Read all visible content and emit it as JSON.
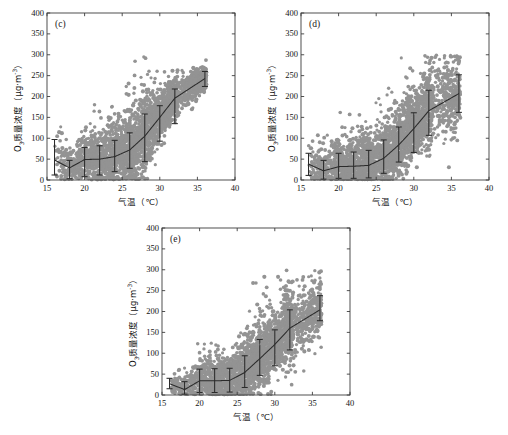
{
  "figure": {
    "background_color": "#ffffff",
    "scatter_color": "#939393",
    "line_color": "#2b2b2b",
    "axis_color": "#3d3d3d",
    "text_color": "#141414"
  },
  "axis_titles": {
    "x": "气温（℃）",
    "x_plain": "气温 (℃)",
    "y_prefix": "O",
    "y_sub": "3",
    "y_mid": "质量浓度（μg·m",
    "y_sup": "-3",
    "y_suffix": "）"
  },
  "ticks": {
    "x_labels": [
      "15",
      "20",
      "25",
      "30",
      "35",
      "40"
    ],
    "x_values": [
      15,
      20,
      25,
      30,
      35,
      40
    ],
    "y_labels": [
      "0",
      "50",
      "100",
      "150",
      "200",
      "250",
      "300",
      "350",
      "400"
    ],
    "y_values": [
      0,
      50,
      100,
      150,
      200,
      250,
      300,
      350,
      400
    ]
  },
  "chart_data": [
    {
      "id": "panel-c",
      "type": "scatter",
      "title": "(c)",
      "xlabel": "气温（℃）",
      "ylabel": "O3质量浓度（μg·m-3）",
      "xlim": [
        15,
        40
      ],
      "ylim": [
        0,
        400
      ],
      "grid": false,
      "legend": "none",
      "n_points": 2600,
      "scatter_hint": {
        "x_range": [
          16.0,
          36.2
        ],
        "core_x_range": [
          19.5,
          32.5
        ],
        "trend": "monotonic-increasing-convex",
        "spread_note": "dense saturated cloud between 20-32 C spanning 0-200; sparse tail above 32 C up to 300"
      },
      "mean_curve": {
        "x": [
          16,
          18,
          20,
          22,
          24,
          26,
          28,
          30,
          32,
          36
        ],
        "y": [
          48,
          29,
          49,
          50,
          56,
          72,
          105,
          150,
          196,
          243
        ]
      },
      "error_bars": {
        "x": [
          16,
          18,
          20,
          22,
          24,
          26,
          28,
          30,
          32,
          36
        ],
        "mean": [
          48,
          29,
          49,
          50,
          56,
          72,
          105,
          150,
          196,
          243
        ],
        "lower": [
          12,
          3,
          8,
          12,
          20,
          28,
          44,
          93,
          135,
          224
        ],
        "upper": [
          97,
          47,
          78,
          82,
          95,
          113,
          158,
          178,
          218,
          260
        ]
      }
    },
    {
      "id": "panel-d",
      "type": "scatter",
      "title": "(d)",
      "xlabel": "气温（℃）",
      "ylabel": "O3质量浓度（μg·m-3）",
      "xlim": [
        15,
        40
      ],
      "ylim": [
        0,
        400
      ],
      "grid": false,
      "legend": "none",
      "n_points": 2600,
      "scatter_hint": {
        "x_range": [
          16.0,
          36.2
        ],
        "core_x_range": [
          19.5,
          32.5
        ],
        "trend": "monotonic-increasing-convex",
        "spread_note": "dense cloud 20-32 C spanning 0-150; sparse tail above 32 C up to 295"
      },
      "mean_curve": {
        "x": [
          16,
          18,
          20,
          22,
          24,
          26,
          28,
          30,
          32,
          36
        ],
        "y": [
          38,
          22,
          32,
          33,
          35,
          52,
          84,
          123,
          166,
          207
        ]
      },
      "error_bars": {
        "x": [
          16,
          18,
          20,
          22,
          24,
          26,
          28,
          30,
          32,
          36
        ],
        "mean": [
          38,
          22,
          32,
          33,
          35,
          52,
          84,
          123,
          166,
          207
        ],
        "lower": [
          11,
          2,
          4,
          4,
          5,
          16,
          43,
          66,
          107,
          162
        ],
        "upper": [
          64,
          47,
          64,
          67,
          71,
          96,
          127,
          161,
          215,
          252
        ]
      }
    },
    {
      "id": "panel-e",
      "type": "scatter",
      "title": "(e)",
      "xlabel": "气温（℃）",
      "ylabel": "O3质量浓度（μg·m-3）",
      "xlim": [
        15,
        40
      ],
      "ylim": [
        0,
        400
      ],
      "grid": false,
      "legend": "none",
      "n_points": 2500,
      "scatter_hint": {
        "x_range": [
          16.0,
          36.2
        ],
        "core_x_range": [
          19.5,
          32.5
        ],
        "trend": "monotonic-increasing-near-linear",
        "spread_note": "dense cloud 20-32 C spanning 0-150; sparse tail above 32 C up to 280"
      },
      "mean_curve": {
        "x": [
          16,
          18,
          20,
          22,
          24,
          26,
          28,
          30,
          32,
          36
        ],
        "y": [
          27,
          13,
          34,
          34,
          35,
          54,
          87,
          121,
          160,
          204
        ]
      },
      "error_bars": {
        "x": [
          16,
          18,
          20,
          22,
          24,
          26,
          28,
          30,
          32,
          36
        ],
        "mean": [
          27,
          13,
          34,
          34,
          35,
          54,
          87,
          121,
          160,
          204
        ],
        "lower": [
          15,
          2,
          6,
          6,
          7,
          18,
          47,
          70,
          108,
          178
        ],
        "upper": [
          40,
          32,
          62,
          63,
          64,
          94,
          133,
          156,
          204,
          238
        ]
      }
    }
  ]
}
